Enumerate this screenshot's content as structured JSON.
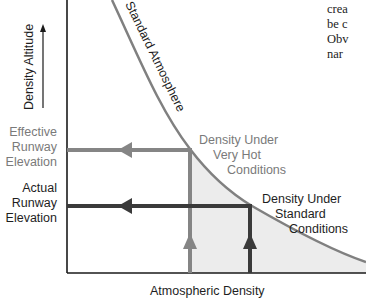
{
  "diagram": {
    "y_axis": {
      "label": "Density Altitude",
      "arrow": "up-arrow"
    },
    "x_axis": {
      "label": "Atmospheric Density"
    },
    "curve": {
      "label": "Standard Atmosphere"
    },
    "fill_color": "#ececec",
    "colors": {
      "very_hot": "#808080",
      "standard": "#3a3a3a",
      "axis": "#1a1a1a",
      "curve": "#808080"
    },
    "y_labels": {
      "effective": {
        "line1": "Effective",
        "line2": "Runway",
        "line3": "Elevation"
      },
      "actual": {
        "line1": "Actual",
        "line2": "Runway",
        "line3": "Elevation"
      }
    },
    "annotations": {
      "very_hot": {
        "line1": "Density Under",
        "line2": "Very Hot",
        "line3": "Conditions"
      },
      "standard": {
        "line1": "Density Under",
        "line2": "Standard",
        "line3": "Conditions"
      }
    }
  },
  "body_text_fragments": [
    "crea",
    "be c",
    "Obv",
    "nar"
  ]
}
